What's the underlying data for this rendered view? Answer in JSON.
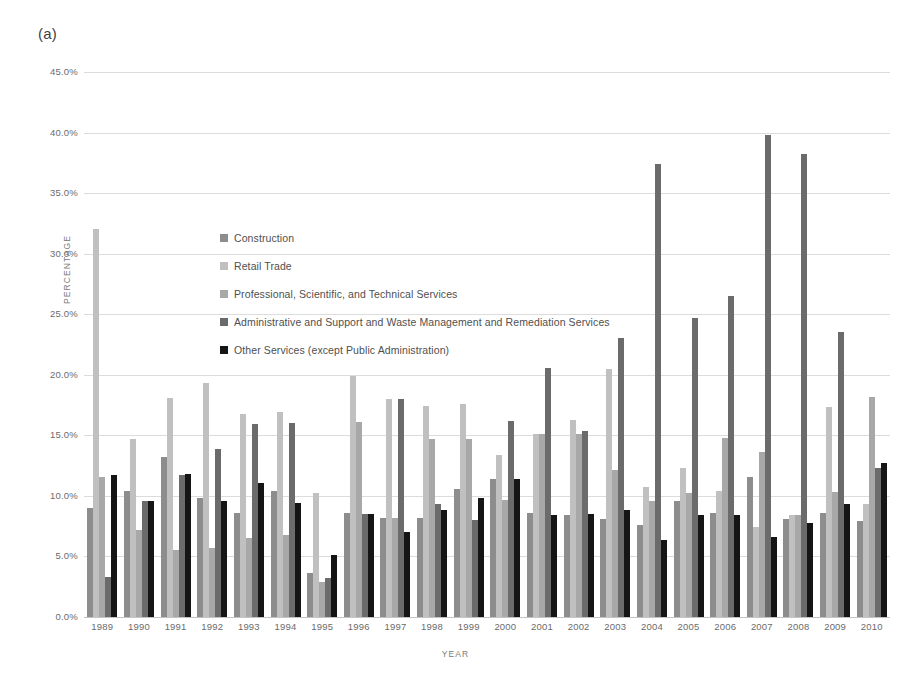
{
  "figure": {
    "panel_label": "(a)",
    "background": "#ffffff"
  },
  "axes": {
    "ylabel": "PERCENTAGE",
    "xlabel": "YEAR",
    "yticks": [
      "0.0%",
      "5.0%",
      "10.0%",
      "15.0%",
      "20.0%",
      "25.0%",
      "30.0%",
      "35.0%",
      "40.0%",
      "45.0%"
    ],
    "ymin": 0,
    "ymax": 45,
    "ystep": 5,
    "grid": true
  },
  "legend": {
    "position": "upper-left-inside",
    "entries": [
      {
        "label": "Construction",
        "color": "#8d8d8d"
      },
      {
        "label": "Retail Trade",
        "color": "#c0c0c0"
      },
      {
        "label": "Professional, Scientific, and Technical Services",
        "color": "#a8a8a8"
      },
      {
        "label": "Administrative and Support and Waste Management and Remediation Services",
        "color": "#6b6b6b"
      },
      {
        "label": "Other Services (except Public Administration)",
        "color": "#151515"
      }
    ]
  },
  "chart_data": {
    "type": "bar",
    "title": "(a)",
    "xlabel": "YEAR",
    "ylabel": "PERCENTAGE",
    "ylim": [
      0,
      45
    ],
    "ytick_step": 5,
    "grid": true,
    "legend_position": "upper-left-inside",
    "categories": [
      "1989",
      "1990",
      "1991",
      "1992",
      "1993",
      "1994",
      "1995",
      "1996",
      "1997",
      "1998",
      "1999",
      "2000",
      "2001",
      "2002",
      "2003",
      "2004",
      "2005",
      "2006",
      "2007",
      "2008",
      "2009",
      "2010"
    ],
    "series": [
      {
        "name": "Construction",
        "color": "#8d8d8d",
        "values": [
          9.0,
          10.4,
          13.2,
          9.8,
          8.6,
          10.4,
          3.6,
          8.6,
          8.2,
          8.2,
          10.6,
          11.4,
          8.6,
          8.4,
          8.1,
          7.6,
          9.6,
          8.6,
          11.6,
          8.1,
          8.6,
          7.9
        ]
      },
      {
        "name": "Retail Trade",
        "color": "#c0c0c0",
        "values": [
          32.0,
          14.7,
          18.1,
          19.3,
          16.8,
          16.9,
          10.2,
          19.9,
          18.0,
          17.4,
          17.6,
          13.4,
          15.1,
          16.3,
          20.5,
          10.7,
          12.3,
          10.4,
          7.4,
          8.4,
          17.3,
          9.3
        ]
      },
      {
        "name": "Professional, Scientific, and Technical Services",
        "color": "#a8a8a8",
        "values": [
          11.6,
          7.2,
          5.5,
          5.7,
          6.5,
          6.8,
          2.9,
          16.1,
          8.2,
          14.7,
          14.7,
          9.7,
          15.1,
          15.1,
          12.1,
          9.6,
          10.2,
          14.8,
          13.6,
          8.4,
          10.3,
          18.2
        ]
      },
      {
        "name": "Administrative and Support and Waste Management and Remediation Services",
        "color": "#6b6b6b",
        "values": [
          3.3,
          9.6,
          11.7,
          13.9,
          15.9,
          16.0,
          3.2,
          8.5,
          18.0,
          9.3,
          8.0,
          16.2,
          20.6,
          15.4,
          23.0,
          37.4,
          24.7,
          26.5,
          39.8,
          38.2,
          23.5,
          12.3
        ]
      },
      {
        "name": "Other Services (except Public Administration)",
        "color": "#151515",
        "values": [
          11.7,
          9.6,
          11.8,
          9.6,
          11.1,
          9.4,
          5.1,
          8.5,
          7.0,
          8.8,
          9.8,
          11.4,
          8.4,
          8.5,
          8.8,
          6.4,
          8.4,
          8.4,
          6.6,
          7.8,
          9.3,
          12.7
        ]
      }
    ]
  }
}
